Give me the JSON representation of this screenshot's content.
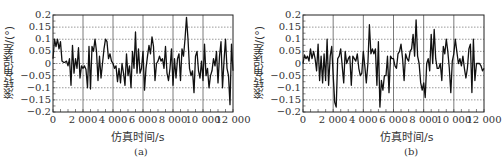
{
  "chart_data": [
    {
      "type": "line",
      "panel_label": "(a)",
      "title": "",
      "xlabel": "仿真时间/s",
      "ylabel": "滚转角误差/(°)",
      "xlim": [
        0,
        12000
      ],
      "ylim": [
        -0.2,
        0.2
      ],
      "xticks": [
        "0",
        "2 000",
        "4 000",
        "6 000",
        "8 000",
        "10 000",
        "12 000"
      ],
      "yticks": [
        "0.2",
        "0.15",
        "0.1",
        "0.05",
        "0",
        "-0.05",
        "-0.1",
        "-0.15",
        "-0.2"
      ],
      "grid": true,
      "legend": null,
      "series": [
        {
          "name": "roll angle error",
          "color": "#111111",
          "x_step": 100,
          "values": [
            0.02,
            0.1,
            0.07,
            0.1,
            0.06,
            0.09,
            0.01,
            0.005,
            0.005,
            0.01,
            -0.01,
            0.02,
            -0.09,
            0.075,
            -0.04,
            0.02,
            -0.02,
            0.065,
            -0.06,
            -0.01,
            -0.02,
            -0.01,
            -0.025,
            -0.1,
            0.07,
            -0.105,
            0.07,
            0.05,
            0.1,
            0.05,
            -0.07,
            0.03,
            -0.06,
            0.0,
            0.06,
            0.1,
            0.09,
            0.02,
            0.04,
            0.01,
            0.0,
            -0.02,
            -0.01,
            -0.075,
            -0.02,
            -0.08,
            0.0,
            -0.04,
            -0.09,
            0.04,
            -0.05,
            -0.01,
            -0.1,
            0.05,
            -0.02,
            0.13,
            -0.04,
            0.06,
            -0.04,
            -0.02,
            0.05,
            -0.11,
            -0.02,
            0.03,
            0.075,
            0.04,
            0.11,
            0.07,
            -0.07,
            0.0,
            0.01,
            0.03,
            0.01,
            0.02,
            -0.02,
            0.07,
            -0.04,
            -0.07,
            -0.02,
            0.06,
            -0.09,
            0.02,
            -0.06,
            0.02,
            0.04,
            -0.07,
            0.06,
            0.03,
            0.1,
            0.19,
            0.1,
            -0.02,
            -0.05,
            -0.03,
            -0.12,
            0.03,
            0.05,
            -0.03,
            -0.06,
            0.01,
            -0.07,
            0.08,
            -0.05,
            -0.02,
            -0.1,
            -0.05,
            -0.03,
            0.02,
            -0.01,
            0.05,
            -0.08,
            0.03,
            0.09,
            -0.1,
            0.01,
            0.1,
            -0.02,
            -0.05,
            -0.17,
            0.08,
            -0.03
          ]
        }
      ]
    },
    {
      "type": "line",
      "panel_label": "(b)",
      "title": "",
      "xlabel": "仿真时间/s",
      "ylabel": "滚转角误差/(°)",
      "xlim": [
        0,
        12000
      ],
      "ylim": [
        -0.2,
        0.2
      ],
      "xticks": [
        "0",
        "2 000",
        "4 000",
        "6 000",
        "8 000",
        "10 000",
        "12 000"
      ],
      "yticks": [
        "0.2",
        "0.15",
        "0.1",
        "0.05",
        "0",
        "-0.05",
        "-0.1",
        "-0.15",
        "-0.2"
      ],
      "grid": true,
      "legend": null,
      "series": [
        {
          "name": "roll angle error",
          "color": "#111111",
          "x_step": 100,
          "values": [
            0.0,
            0.035,
            0.02,
            0.03,
            0.01,
            0.06,
            0.02,
            0.05,
            0.02,
            -0.03,
            0.08,
            -0.07,
            0.03,
            -0.08,
            0.04,
            -0.07,
            0.1,
            -0.09,
            0.03,
            0.07,
            -0.05,
            -0.16,
            -0.18,
            0.02,
            0.03,
            0.06,
            -0.01,
            -0.08,
            0.05,
            0.0,
            0.02,
            0.03,
            -0.09,
            0.03,
            0.02,
            0.01,
            0.04,
            -0.02,
            -0.05,
            -0.04,
            0.05,
            -0.01,
            -0.08,
            0.0,
            0.16,
            0.04,
            0.06,
            0.04,
            0.06,
            -0.09,
            0.09,
            -0.18,
            -0.07,
            -0.11,
            -0.05,
            -0.05,
            0.03,
            -0.12,
            0.03,
            0.02,
            0.02,
            -0.01,
            -0.02,
            0.04,
            0.05,
            0.08,
            0.02,
            -0.07,
            0.04,
            0.02,
            0.01,
            0.05,
            0.06,
            0.12,
            0.03,
            0.18,
            0.03,
            0.0,
            -0.08,
            -0.11,
            -0.08,
            -0.14,
            0.0,
            0.02,
            -0.03,
            0.12,
            0.0,
            0.14,
            0.02,
            -0.02,
            -0.02,
            0.0,
            -0.07,
            0.07,
            0.04,
            0.1,
            0.05,
            -0.02,
            -0.12,
            0.01,
            0.04,
            0.1,
            0.05,
            0.0,
            0.02,
            -0.01,
            0.03,
            -0.02,
            -0.06,
            -0.02,
            0.06,
            0.08,
            -0.12,
            0.1,
            -0.07,
            0.0,
            0.0,
            0.0,
            -0.01,
            -0.03,
            -0.02
          ]
        }
      ]
    }
  ],
  "panels": {
    "a": {
      "ylabel": "滚转角误差/(°)",
      "xlabel": "仿真时间/s",
      "caption": "(a)"
    },
    "b": {
      "ylabel": "滚转角误差/(°)",
      "xlabel": "仿真时间/s",
      "caption": "(b)"
    }
  },
  "axis": {
    "yticks": [
      "0.2",
      "0.15",
      "0.1",
      "0.05",
      "0",
      "−0.05",
      "−0.1",
      "−0.15",
      "−0.2"
    ],
    "xticks": [
      "0",
      "2 000",
      "4 000",
      "6 000",
      "8 000",
      "10 000",
      "12 000"
    ]
  }
}
